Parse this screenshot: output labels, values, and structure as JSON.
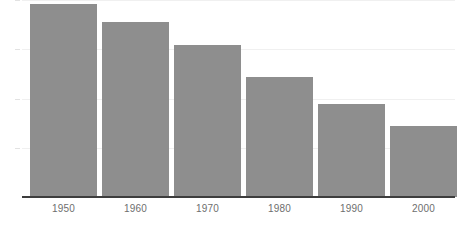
{
  "chart_data": {
    "type": "bar",
    "title": "",
    "subtitle": "",
    "xlabel": "",
    "ylabel": "",
    "categories": [
      "1950",
      "1960",
      "1970",
      "1980",
      "1990",
      "2000"
    ],
    "values": [
      98,
      89,
      77,
      61,
      47,
      36
    ],
    "series": [
      {
        "name": "",
        "values": [
          98,
          89,
          77,
          61,
          47,
          36
        ]
      }
    ],
    "ylim": [
      0,
      100
    ],
    "yticks": [
      25,
      50,
      75,
      100
    ],
    "ytick_labels": [
      "",
      "",
      "",
      ""
    ],
    "grid": true,
    "grid_axis": "y",
    "legend": false,
    "legend_position": "none",
    "annotations": [],
    "bar_color": "#8e8e8e",
    "grid_color": "#f0f0f0",
    "tick_color": "#e2e2e2",
    "axis_color": "#3d3d3d",
    "label_color": "#6e6e6e",
    "background_color": "#ffffff"
  },
  "axis": {
    "x_tick_labels": [
      "1950",
      "1960",
      "1970",
      "1980",
      "1990",
      "2000"
    ],
    "y_tick_labels": [
      "",
      "",
      "",
      ""
    ]
  }
}
